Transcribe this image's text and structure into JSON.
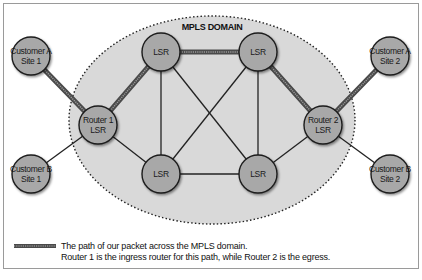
{
  "diagram": {
    "domain": {
      "label": "MPLS DOMAIN",
      "fill": "#d9d9d9",
      "border_style": "dotted"
    },
    "colors": {
      "node_fill": "#a8a8a8",
      "node_stroke": "#1e1e1e",
      "link": "#222222",
      "path_outer": "#4a4a4a",
      "path_inner": "#9a9a9a"
    },
    "nodes": [
      {
        "id": "cust_a_site1",
        "lines": [
          "Customer A",
          "Site 1"
        ],
        "x": 31,
        "y": 56
      },
      {
        "id": "cust_b_site1",
        "lines": [
          "Customer B",
          "Site 1"
        ],
        "x": 31,
        "y": 174
      },
      {
        "id": "router1",
        "lines": [
          "Router 1",
          "LSR"
        ],
        "x": 98,
        "y": 125
      },
      {
        "id": "lsr_top_left",
        "lines": [
          "LSR"
        ],
        "x": 161,
        "y": 52
      },
      {
        "id": "lsr_top_right",
        "lines": [
          "LSR"
        ],
        "x": 258,
        "y": 52
      },
      {
        "id": "lsr_bottom_left",
        "lines": [
          "LSR"
        ],
        "x": 161,
        "y": 174
      },
      {
        "id": "lsr_bottom_right",
        "lines": [
          "LSR"
        ],
        "x": 258,
        "y": 174
      },
      {
        "id": "router2",
        "lines": [
          "Router 2",
          "LSR"
        ],
        "x": 323,
        "y": 125
      },
      {
        "id": "cust_a_site2",
        "lines": [
          "Customer A",
          "Site 2"
        ],
        "x": 390,
        "y": 56
      },
      {
        "id": "cust_b_site2",
        "lines": [
          "Customer B",
          "Site 2"
        ],
        "x": 390,
        "y": 174
      }
    ],
    "links": [
      [
        "cust_b_site1",
        "router1"
      ],
      [
        "router1",
        "lsr_bottom_left"
      ],
      [
        "lsr_top_left",
        "lsr_bottom_left"
      ],
      [
        "lsr_top_left",
        "lsr_bottom_right"
      ],
      [
        "lsr_top_right",
        "lsr_bottom_left"
      ],
      [
        "lsr_top_right",
        "lsr_bottom_right"
      ],
      [
        "lsr_bottom_left",
        "lsr_bottom_right"
      ],
      [
        "lsr_bottom_right",
        "router2"
      ],
      [
        "router2",
        "cust_b_site2"
      ]
    ],
    "packet_path": [
      "cust_a_site1",
      "router1",
      "lsr_top_left",
      "lsr_top_right",
      "router2",
      "cust_a_site2"
    ],
    "legend": {
      "line1": "The path of our packet across the MPLS domain.",
      "line2": "Router 1 is the ingress router for this path, while Router 2 is the egress."
    }
  }
}
